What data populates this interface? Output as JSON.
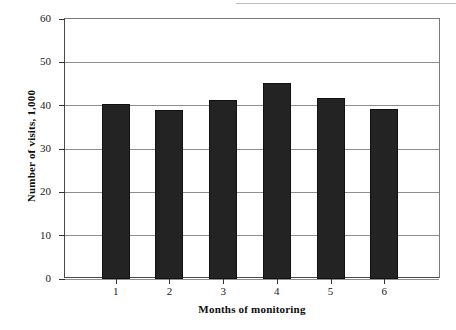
{
  "chart_data": {
    "type": "bar",
    "title": "",
    "xlabel": "Months of monitoring",
    "ylabel": "Number of visits, 1,000",
    "categories": [
      "1",
      "2",
      "3",
      "4",
      "5",
      "6"
    ],
    "values": [
      40.5,
      38.9,
      41.3,
      45.3,
      41.8,
      39.2
    ],
    "series": [
      {
        "name": "Number of visits",
        "values": [
          40.5,
          38.9,
          41.3,
          45.3,
          41.8,
          39.2
        ]
      }
    ],
    "ylim": [
      0,
      60
    ],
    "yticks": [
      0,
      10,
      20,
      30,
      40,
      50,
      60
    ],
    "ytick_labels": [
      "0",
      "10",
      "20",
      "30",
      "40",
      "50",
      "60"
    ],
    "xtick_labels": [
      "1",
      "2",
      "3",
      "4",
      "5",
      "6"
    ],
    "grid": true,
    "grid_axis": "y",
    "legend": false,
    "legend_position": "none",
    "bar_color": "#232323",
    "axis_color": "#333333",
    "gridline_color": "#8e8e8e",
    "background_color": "#ffffff"
  }
}
